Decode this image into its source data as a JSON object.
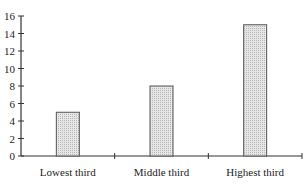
{
  "chart_data": {
    "type": "bar",
    "title": "",
    "xlabel": "",
    "ylabel": "",
    "categories": [
      "Lowest third",
      "Middle third",
      "Highest third"
    ],
    "values": [
      5,
      8,
      15
    ],
    "ylim": [
      0,
      16
    ],
    "yticks": [
      0,
      2,
      4,
      6,
      8,
      10,
      12,
      14,
      16
    ],
    "grid": false,
    "legend": null,
    "bar_fill": "#dcdcdc",
    "bar_stroke": "#555555",
    "bar_pattern": "dotted-hatch"
  }
}
